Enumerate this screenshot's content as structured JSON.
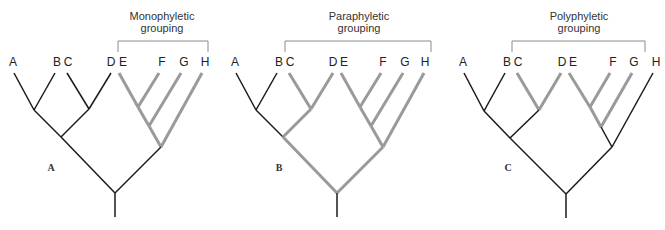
{
  "figure": {
    "colors": {
      "highlight": "#9a9a9a",
      "base": "#1a1a1a",
      "bracket": "#8a8a8a"
    },
    "panels": [
      {
        "panel_label": "A",
        "title_line1": "Monophyletic",
        "title_line2": "grouping",
        "taxa": [
          "A",
          "B",
          "C",
          "D",
          "E",
          "F",
          "G",
          "H"
        ],
        "grouped_taxa": [
          "E",
          "F",
          "G",
          "H"
        ],
        "highlighted_edges": [
          "E1",
          "F",
          "E2",
          "G",
          "E3",
          "H"
        ]
      },
      {
        "panel_label": "B",
        "title_line1": "Paraphyletic",
        "title_line2": "grouping",
        "taxa": [
          "A",
          "B",
          "C",
          "D",
          "E",
          "F",
          "G",
          "H"
        ],
        "grouped_taxa": [
          "C",
          "D",
          "E",
          "F",
          "G",
          "H"
        ],
        "highlighted_edges": [
          "C",
          "D",
          "CD-ABCD",
          "ABCD-root",
          "E1",
          "F",
          "E2",
          "G",
          "E3",
          "H",
          "EFGH-root"
        ]
      },
      {
        "panel_label": "C",
        "title_line1": "Polyphyletic",
        "title_line2": "grouping",
        "taxa": [
          "A",
          "B",
          "C",
          "D",
          "E",
          "F",
          "G",
          "H"
        ],
        "grouped_taxa": [
          "C",
          "D",
          "E",
          "F",
          "G"
        ],
        "highlighted_edges": [
          "C",
          "D",
          "E1",
          "F",
          "E2",
          "G"
        ]
      }
    ]
  }
}
